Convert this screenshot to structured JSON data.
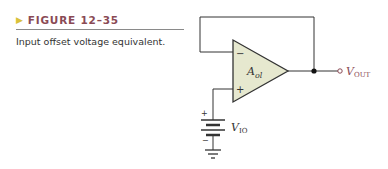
{
  "figure": {
    "number_label": "FIGURE 12–35",
    "arrow_glyph": "▶",
    "description": "Input offset voltage equivalent."
  },
  "circuit": {
    "opamp_label_main": "A",
    "opamp_label_sub": "ol",
    "inverting_sign": "−",
    "noninverting_sign": "+",
    "output_label_main": "V",
    "output_label_sub": "OUT",
    "battery_plus": "+",
    "battery_minus": "−",
    "source_label_main": "V",
    "source_label_sub": "IO"
  },
  "colors": {
    "opamp_fill": "#e6e8cf",
    "label_color": "#8a4a55",
    "arrow_color": "#d9c13a",
    "wire": "#333333"
  }
}
